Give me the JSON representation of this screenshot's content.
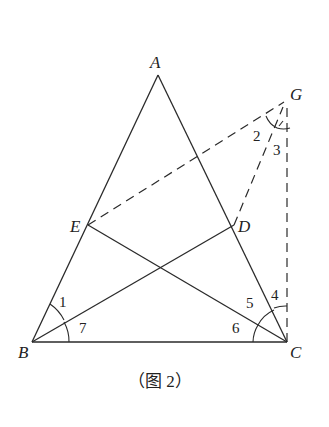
{
  "diagram": {
    "type": "geometry",
    "points": {
      "A": {
        "label": "A",
        "x": 158,
        "y": 75
      },
      "B": {
        "label": "B",
        "x": 32,
        "y": 342
      },
      "C": {
        "label": "C",
        "x": 287,
        "y": 342
      },
      "D": {
        "label": "D",
        "x": 234,
        "y": 225
      },
      "E": {
        "label": "E",
        "x": 88,
        "y": 225
      },
      "G": {
        "label": "G",
        "x": 287,
        "y": 100
      }
    },
    "solid_segments": [
      "AB",
      "AC",
      "BC",
      "BD",
      "CE"
    ],
    "dashed_segments": [
      "EG",
      "DG",
      "CG"
    ],
    "angles": {
      "a1": "1",
      "a2": "2",
      "a3": "3",
      "a4": "4",
      "a5": "5",
      "a6": "6",
      "a7": "7"
    },
    "caption": "（图 2）"
  }
}
